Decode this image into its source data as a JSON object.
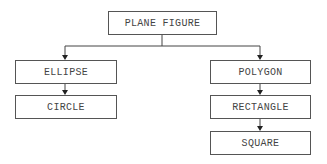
{
  "diagram": {
    "type": "hierarchy",
    "root": {
      "label": "PLANE FIGURE"
    },
    "nodes": [
      {
        "id": "plane_figure",
        "label": "PLANE FIGURE"
      },
      {
        "id": "ellipse",
        "label": "ELLIPSE"
      },
      {
        "id": "circle",
        "label": "CIRCLE"
      },
      {
        "id": "polygon",
        "label": "POLYGON"
      },
      {
        "id": "rectangle",
        "label": "RECTANGLE"
      },
      {
        "id": "square",
        "label": "SQUARE"
      }
    ],
    "edges": [
      {
        "from": "PLANE FIGURE",
        "to": "ELLIPSE"
      },
      {
        "from": "PLANE FIGURE",
        "to": "POLYGON"
      },
      {
        "from": "ELLIPSE",
        "to": "CIRCLE"
      },
      {
        "from": "POLYGON",
        "to": "RECTANGLE"
      },
      {
        "from": "RECTANGLE",
        "to": "SQUARE"
      }
    ]
  }
}
